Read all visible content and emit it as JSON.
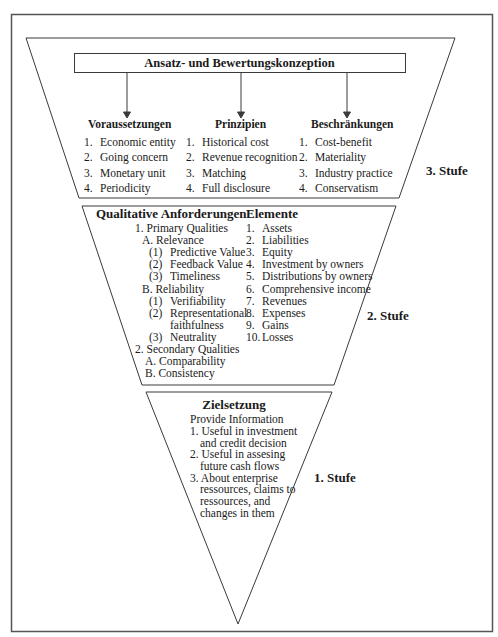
{
  "diagram": {
    "colors": {
      "line": "#3a3a3a",
      "frame": "#555555",
      "text": "#1a1a1a",
      "background": "#ffffff"
    },
    "level3": {
      "stage_label": "3. Stufe",
      "box_title": "Ansatz- und Bewertungskonzeption",
      "columns": [
        {
          "header": "Voraussetzungen",
          "items": [
            {
              "num": "1.",
              "text": "Economic entity"
            },
            {
              "num": "2.",
              "text": "Going concern"
            },
            {
              "num": "3.",
              "text": "Monetary unit"
            },
            {
              "num": "4.",
              "text": "Periodicity"
            }
          ]
        },
        {
          "header": "Prinzipien",
          "items": [
            {
              "num": "1.",
              "text": "Historical cost"
            },
            {
              "num": "2.",
              "text": "Revenue recognition"
            },
            {
              "num": "3.",
              "text": "Matching"
            },
            {
              "num": "4.",
              "text": "Full disclosure"
            }
          ]
        },
        {
          "header": "Beschränkungen",
          "items": [
            {
              "num": "1.",
              "text": "Cost-benefit"
            },
            {
              "num": "2.",
              "text": "Materiality"
            },
            {
              "num": "3.",
              "text": "Industry practice"
            },
            {
              "num": "4.",
              "text": "Conservatism"
            }
          ]
        }
      ]
    },
    "level2": {
      "stage_label": "2. Stufe",
      "qualitative": {
        "header": "Qualitative Anforderungen",
        "lines": [
          "1. Primary Qualities",
          "A. Relevance",
          "(1)",
          "Predictive Value",
          "(2)",
          "Feedback Value",
          "(3)",
          "Timeliness",
          "B. Reliability",
          "(1)",
          "Verifiability",
          "(2)",
          "Representational",
          "faithfulness",
          "(3)",
          "Neutrality",
          "2. Secondary Qualities",
          "A. Comparability",
          "B. Consistency"
        ]
      },
      "elements": {
        "header": "Elemente",
        "items": [
          {
            "num": "1.",
            "text": "Assets"
          },
          {
            "num": "2.",
            "text": "Liabilities"
          },
          {
            "num": "3.",
            "text": "Equity"
          },
          {
            "num": "4.",
            "text": "Investment by owners"
          },
          {
            "num": "5.",
            "text": "Distributions by owners"
          },
          {
            "num": "6.",
            "text": "Comprehensive income"
          },
          {
            "num": "7.",
            "text": "Revenues"
          },
          {
            "num": "8.",
            "text": "Expenses"
          },
          {
            "num": "9.",
            "text": "Gains"
          },
          {
            "num": "10.",
            "text": "Losses"
          }
        ]
      }
    },
    "level1": {
      "stage_label": "1. Stufe",
      "header": "Zielsetzung",
      "subheader": "Provide Information",
      "lines": [
        "1. Useful in investment",
        "and credit decision",
        "2. Useful in assesing",
        "future cash flows",
        "3. About enterprise",
        "ressources, claims to",
        "ressources, and",
        "changes in them"
      ]
    }
  }
}
